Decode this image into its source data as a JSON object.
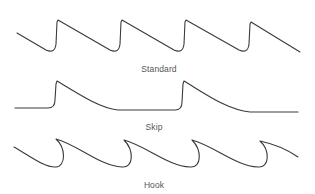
{
  "figure": {
    "panels": [
      {
        "id": "standard",
        "label": "Standard"
      },
      {
        "id": "skip",
        "label": "Skip"
      },
      {
        "id": "hook",
        "label": "Hook"
      }
    ],
    "colors": {
      "stroke": "#3a3a3a",
      "label": "#555555",
      "background": "#ffffff"
    }
  }
}
